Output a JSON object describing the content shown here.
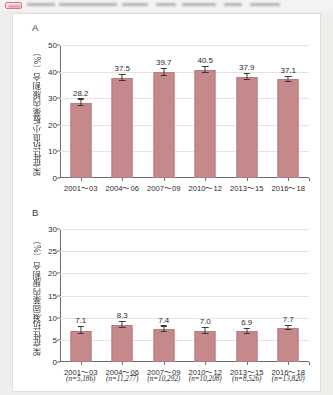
{
  "topbar": {
    "badge_label": "",
    "title_blurred": ""
  },
  "chart_data": [
    {
      "type": "bar",
      "panel": "A",
      "title": "",
      "xlabel": "",
      "ylabel": "架症性抗血小板薬内服割合（%）",
      "ylim": [
        0,
        50
      ],
      "yticks": [
        0,
        10,
        20,
        30,
        40,
        50
      ],
      "grid": true,
      "categories": [
        "2001～03",
        "2004～06",
        "2007～09",
        "2010～12",
        "2013～15",
        "2016～18"
      ],
      "values": [
        28.2,
        37.5,
        39.7,
        40.5,
        37.9,
        37.1
      ],
      "value_labels": [
        "28.2",
        "37.5",
        "39.7",
        "40.5",
        "37.9",
        "37.1"
      ],
      "errors": [
        1.3,
        1.2,
        1.2,
        1.2,
        1.2,
        1.0
      ],
      "bar_color": "#c5888b",
      "legend": []
    },
    {
      "type": "bar",
      "panel": "B",
      "title": "",
      "xlabel": "",
      "ylabel": "架症性抗凝固薬内服割合（%）",
      "ylim": [
        0,
        30
      ],
      "yticks": [
        0,
        5,
        10,
        15,
        20,
        25,
        30
      ],
      "grid": true,
      "categories": [
        "2001～03",
        "2004～06",
        "2007～09",
        "2010～12",
        "2013～15",
        "2016～18"
      ],
      "values": [
        7.1,
        8.3,
        7.4,
        7.0,
        6.9,
        7.7
      ],
      "value_labels": [
        "7.1",
        "8.3",
        "7.4",
        "7.0",
        "6.9",
        "7.7"
      ],
      "errors": [
        0.8,
        0.7,
        0.6,
        0.6,
        0.6,
        0.5
      ],
      "n_labels": [
        "(n=5,186)",
        "(n=11,277)",
        "(n=10,292)",
        "(n=10,208)",
        "(n=8,526)",
        "(n=13,820)"
      ],
      "bar_color": "#c5888b",
      "legend": []
    }
  ],
  "panels": {
    "a_letter": "A",
    "b_letter": "B"
  }
}
